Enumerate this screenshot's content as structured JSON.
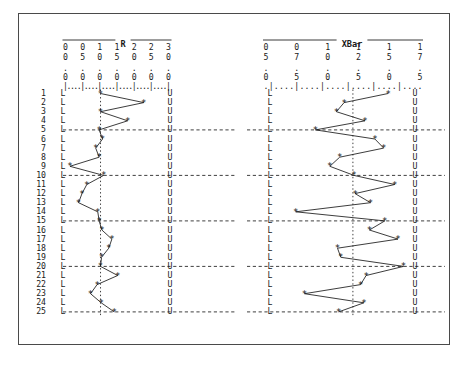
{
  "figure": {
    "background_color": "#ffffff",
    "frame_color": "#4a4a4a",
    "ink_color": "#1a1a1a"
  },
  "charts": [
    {
      "id": "r-chart",
      "title": "R",
      "axis_tick_row": "|....|....|....|....|....|....|",
      "lower_limit_glyph": "L",
      "upper_limit_glyph": "U",
      "center_line_glyph": ":",
      "marker_glyph": "*",
      "axis_tick_labels": [
        "0.00",
        "0.50",
        "1.00",
        "1.50",
        "2.00",
        "2.50",
        "3.00"
      ],
      "axis_min": 0.0,
      "axis_max": 3.0
    },
    {
      "id": "xbar-chart",
      "title": "XBar",
      "axis_tick_row": ".|....|....|....|....|....|....",
      "lower_limit_glyph": "L",
      "upper_limit_glyph": "U",
      "center_line_glyph": ":",
      "marker_glyph": "*",
      "axis_tick_labels": [
        "05.0",
        "07.5",
        "10.0",
        "12.5",
        "15.0",
        "17.5"
      ],
      "axis_min": 4.5,
      "axis_max": 18.5
    }
  ],
  "row_labels": [
    "1",
    "2",
    "3",
    "4",
    "5",
    "6",
    "7",
    "8",
    "9",
    "10",
    "11",
    "12",
    "13",
    "14",
    "15",
    "16",
    "17",
    "18",
    "19",
    "20",
    "21",
    "22",
    "23",
    "24",
    "25"
  ],
  "dashed_rule_rows": [
    5,
    10,
    15,
    20,
    25
  ],
  "chart_data": {
    "type": "line",
    "orientation": "vertical-sample-index",
    "xlabel": "Measurement value",
    "ylabel": "Sample number",
    "grid": false,
    "legend": "none",
    "x": [
      1,
      2,
      3,
      4,
      5,
      6,
      7,
      8,
      9,
      10,
      11,
      12,
      13,
      14,
      15,
      16,
      17,
      18,
      19,
      20,
      21,
      22,
      23,
      24,
      25
    ],
    "series": [
      {
        "name": "R",
        "chart": "r-chart",
        "xlim": [
          0.0,
          3.0
        ],
        "tick_labels": [
          "0.00",
          "0.50",
          "1.00",
          "1.50",
          "2.00",
          "2.50",
          "3.00"
        ],
        "lower_control_limit": 0.0,
        "center_line": 1.02,
        "upper_control_limit": 2.3,
        "values": [
          1.02,
          2.28,
          1.02,
          1.81,
          0.98,
          1.08,
          0.88,
          0.98,
          0.13,
          1.11,
          0.62,
          0.48,
          0.38,
          0.94,
          0.98,
          1.06,
          1.35,
          1.26,
          1.05,
          1.02,
          1.52,
          0.92,
          0.73,
          1.04,
          1.42
        ]
      },
      {
        "name": "XBar",
        "chart": "xbar-chart",
        "xlim": [
          4.5,
          18.5
        ],
        "tick_labels": [
          "05.0",
          "07.5",
          "10.0",
          "12.5",
          "15.0",
          "17.5"
        ],
        "lower_control_limit": 5.0,
        "center_line": 12.4,
        "upper_control_limit": 18.5,
        "values": [
          15.6,
          11.6,
          10.9,
          13.5,
          9.0,
          14.4,
          15.2,
          11.2,
          10.3,
          12.5,
          16.2,
          12.6,
          14.0,
          7.2,
          15.3,
          13.9,
          16.5,
          11.0,
          11.3,
          17.0,
          13.6,
          13.1,
          8.0,
          13.4,
          11.1
        ]
      }
    ]
  }
}
